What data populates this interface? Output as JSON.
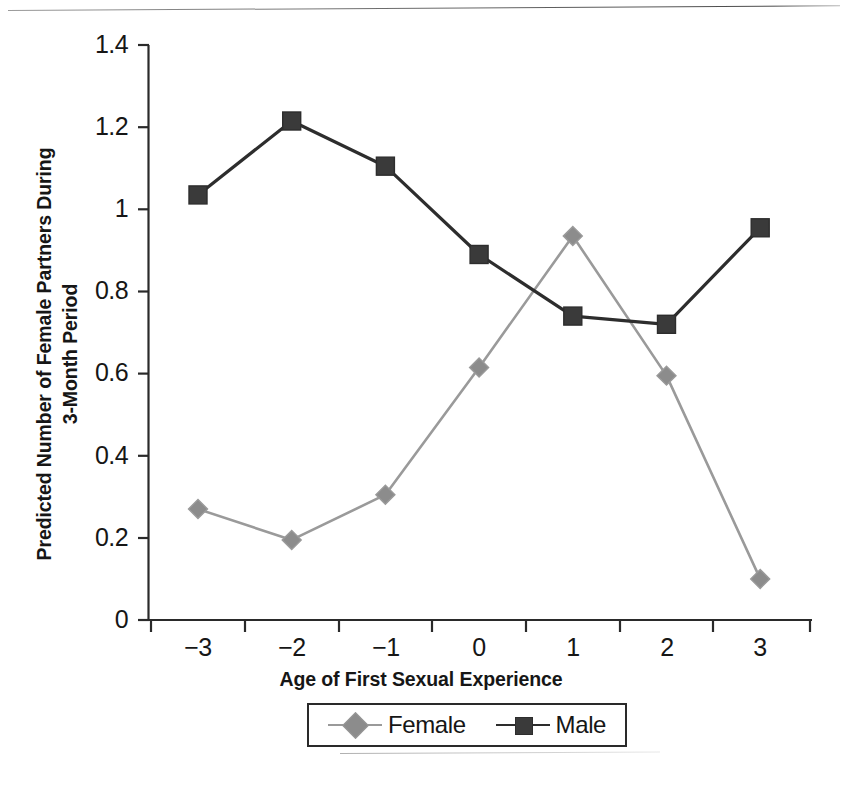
{
  "chart_data": {
    "type": "line",
    "title": "",
    "xlabel": "Age of First Sexual Experience",
    "ylabel": "Predicted Number of Female Partners During\n3-Month Period",
    "categories": [
      "-3",
      "-2",
      "-1",
      "0",
      "1",
      "2",
      "3"
    ],
    "x": [
      -3,
      -2,
      -1,
      0,
      1,
      2,
      3
    ],
    "xtick_labels": [
      "−3",
      "−2",
      "−1",
      "0",
      "1",
      "2",
      "3"
    ],
    "ytick_labels": [
      "0",
      "0.2",
      "0.4",
      "0.6",
      "0.8",
      "1",
      "1.2",
      "1.4"
    ],
    "ytick_values": [
      0,
      0.2,
      0.4,
      0.6,
      0.8,
      1,
      1.2,
      1.4
    ],
    "ylim": [
      0,
      1.4
    ],
    "xlim": [
      -3.5,
      3.5
    ],
    "grid": false,
    "legend_position": "bottom",
    "series": [
      {
        "name": "Female",
        "marker": "diamond",
        "color": "#8c8c8c",
        "line_color": "#9a9a9a",
        "values": [
          0.27,
          0.195,
          0.305,
          0.615,
          0.935,
          0.595,
          0.1
        ]
      },
      {
        "name": "Male",
        "marker": "square",
        "color": "#3a3a3a",
        "line_color": "#2d2d2d",
        "values": [
          1.035,
          1.215,
          1.105,
          0.89,
          0.74,
          0.72,
          0.955
        ]
      }
    ]
  },
  "legend": {
    "entries": [
      {
        "label": "Female"
      },
      {
        "label": "Male"
      }
    ]
  },
  "colors": {
    "female": "#8c8c8c",
    "female_line": "#9a9a9a",
    "male": "#3a3a3a",
    "male_line": "#2d2d2d",
    "axis": "#2a2a2a",
    "text": "#161616"
  }
}
